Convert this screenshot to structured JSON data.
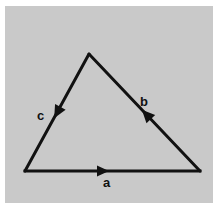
{
  "diagram": {
    "type": "vector-triangle",
    "background_color": "#c9c9c9",
    "stroke_color": "#111111",
    "vertices": {
      "apex": [
        89,
        54
      ],
      "bottom_left": [
        25,
        171
      ],
      "bottom_right": [
        200,
        171
      ]
    },
    "vectors": [
      {
        "label": "a",
        "from": "bottom_left",
        "to": "bottom_right",
        "direction": "right"
      },
      {
        "label": "b",
        "from": "bottom_right",
        "to": "apex",
        "direction": "up-left"
      },
      {
        "label": "c",
        "from": "apex",
        "to": "bottom_left",
        "direction": "down-left"
      }
    ],
    "labels": {
      "a": "a",
      "b": "b",
      "c": "c"
    }
  }
}
